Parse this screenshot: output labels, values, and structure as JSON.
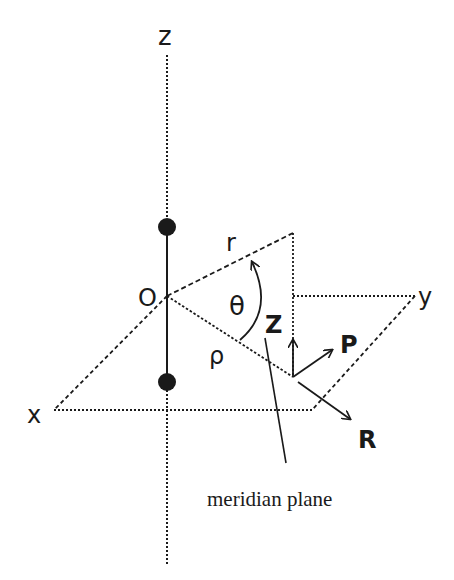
{
  "diagram": {
    "labels": {
      "z_axis": "z",
      "x_axis": "x",
      "y_axis": "y",
      "origin": "O",
      "radius": "r",
      "rho": "ρ",
      "theta": "θ",
      "z_component": "Z",
      "p_component": "P",
      "r_component": "R",
      "meridian": "meridian plane"
    },
    "colors": {
      "ink": "#1a1a1a",
      "background": "#ffffff"
    }
  }
}
